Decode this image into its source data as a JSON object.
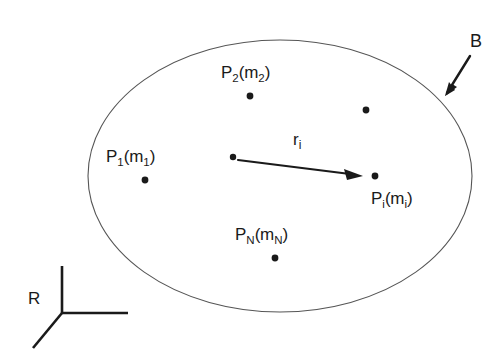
{
  "figure": {
    "type": "free-body-diagram",
    "background_color": "#ffffff",
    "ink_color": "#1a1a1a",
    "outline_color": "#555555"
  },
  "body": {
    "name": "B",
    "label": "B",
    "shape": "ellipse",
    "center_x": 280,
    "center_y": 176,
    "radius_x": 192,
    "radius_y": 136,
    "pointer_arrow": {
      "from_x": 470,
      "from_y": 56,
      "to_x": 445,
      "to_y": 96
    },
    "label_x": 470,
    "label_y": 32
  },
  "particles": [
    {
      "id": "P1",
      "label_p": "P",
      "label_p_sub": "1",
      "label_m": "m",
      "label_m_sub": "1",
      "dot_x": 145,
      "dot_y": 180,
      "label_x": 106,
      "label_y": 148
    },
    {
      "id": "P2",
      "label_p": "P",
      "label_p_sub": "2",
      "label_m": "m",
      "label_m_sub": "2",
      "dot_x": 250,
      "dot_y": 96,
      "label_x": 221,
      "label_y": 64
    },
    {
      "id": "Pi",
      "label_p": "P",
      "label_p_sub": "i",
      "label_m": "m",
      "label_m_sub": "i",
      "dot_x": 375,
      "dot_y": 176,
      "label_x": 371,
      "label_y": 190
    },
    {
      "id": "PN",
      "label_p": "P",
      "label_p_sub": "N",
      "label_m": "m",
      "label_m_sub": "N",
      "dot_x": 275,
      "dot_y": 258,
      "label_x": 235,
      "label_y": 226
    },
    {
      "id": "unlabeled-particle",
      "label_p": "",
      "label_p_sub": "",
      "label_m": "",
      "label_m_sub": "",
      "dot_x": 366,
      "dot_y": 110,
      "label_x": 0,
      "label_y": 0
    }
  ],
  "origin_point": {
    "name": "vector-origin",
    "dot_x": 233,
    "dot_y": 157
  },
  "position_vector": {
    "label": "r",
    "label_sub": "i",
    "from_x": 238,
    "from_y": 160,
    "to_x": 363,
    "to_y": 176,
    "label_x": 293,
    "label_y": 131
  },
  "reference_frame": {
    "label": "R",
    "label_x": 28,
    "label_y": 290,
    "origin_x": 62,
    "origin_y": 313,
    "axis_up_x": 62,
    "axis_up_y": 266,
    "axis_right_x": 128,
    "axis_right_y": 313,
    "axis_diag_x": 33,
    "axis_diag_y": 348
  }
}
